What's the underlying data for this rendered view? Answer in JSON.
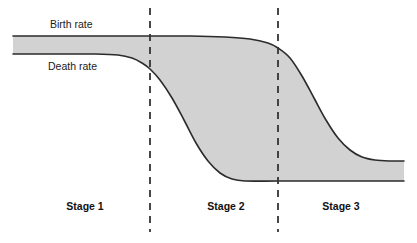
{
  "figure": {
    "background_color": "#ffffff",
    "width": 417,
    "height": 243
  },
  "labels": {
    "birth_rate": "Birth rate",
    "death_rate": "Death rate"
  },
  "stages": [
    {
      "label": "Stage 1",
      "center_x": 85
    },
    {
      "label": "Stage 2",
      "center_x": 226
    },
    {
      "label": "Stage 3",
      "center_x": 341
    }
  ],
  "chart_data": {
    "type": "line",
    "title": "",
    "subtitle": "",
    "xlabel": "",
    "ylabel": "",
    "grid": false,
    "legend_position": "inline-curve-labels",
    "annotations": [
      {
        "text": "Birth rate",
        "x": 50,
        "y": 28
      },
      {
        "text": "Death rate",
        "x": 48,
        "y": 70
      },
      {
        "text": "Stage 1",
        "x": 85,
        "y": 210
      },
      {
        "text": "Stage 2",
        "x": 226,
        "y": 210
      },
      {
        "text": "Stage 3",
        "x": 341,
        "y": 210
      }
    ],
    "divider_lines": [
      {
        "name": "stage-1-2-divider",
        "x": 150,
        "style": "dashed",
        "y_start": 8,
        "y_end": 232
      },
      {
        "name": "stage-2-3-divider",
        "x": 278,
        "style": "dashed",
        "y_start": 8,
        "y_end": 232
      }
    ],
    "colors": {
      "fill": "#d2d2d2",
      "stroke": "#2b2b2b",
      "divider": "#333333",
      "background": "#ffffff"
    },
    "series": [
      {
        "name": "Birth rate",
        "shape": "high-plateau-then-sigmoid-decline",
        "points": [
          {
            "x": 13,
            "y": 36
          },
          {
            "x": 60,
            "y": 36
          },
          {
            "x": 110,
            "y": 36
          },
          {
            "x": 150,
            "y": 36
          },
          {
            "x": 190,
            "y": 36
          },
          {
            "x": 225,
            "y": 37
          },
          {
            "x": 250,
            "y": 39
          },
          {
            "x": 268,
            "y": 43
          },
          {
            "x": 278,
            "y": 48
          },
          {
            "x": 290,
            "y": 58
          },
          {
            "x": 302,
            "y": 76
          },
          {
            "x": 314,
            "y": 98
          },
          {
            "x": 326,
            "y": 120
          },
          {
            "x": 338,
            "y": 138
          },
          {
            "x": 350,
            "y": 150
          },
          {
            "x": 362,
            "y": 157
          },
          {
            "x": 375,
            "y": 160
          },
          {
            "x": 390,
            "y": 161
          },
          {
            "x": 404,
            "y": 161
          }
        ]
      },
      {
        "name": "Death rate",
        "shape": "high-plateau-then-sigmoid-decline-earlier",
        "points": [
          {
            "x": 13,
            "y": 54
          },
          {
            "x": 60,
            "y": 54
          },
          {
            "x": 95,
            "y": 54
          },
          {
            "x": 118,
            "y": 55
          },
          {
            "x": 132,
            "y": 58
          },
          {
            "x": 142,
            "y": 63
          },
          {
            "x": 150,
            "y": 69
          },
          {
            "x": 160,
            "y": 80
          },
          {
            "x": 172,
            "y": 98
          },
          {
            "x": 184,
            "y": 120
          },
          {
            "x": 196,
            "y": 143
          },
          {
            "x": 208,
            "y": 161
          },
          {
            "x": 220,
            "y": 173
          },
          {
            "x": 232,
            "y": 179
          },
          {
            "x": 245,
            "y": 181
          },
          {
            "x": 278,
            "y": 181
          },
          {
            "x": 330,
            "y": 181
          },
          {
            "x": 404,
            "y": 181
          }
        ]
      }
    ],
    "shaded_region": {
      "name": "natural-increase-gap",
      "between": [
        "Birth rate",
        "Death rate"
      ],
      "fill": "#d2d2d2"
    }
  }
}
